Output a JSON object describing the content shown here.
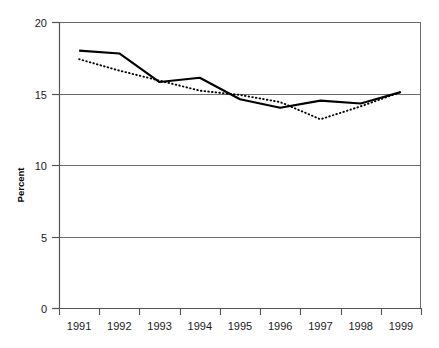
{
  "chart_data": {
    "type": "line",
    "title": "",
    "xlabel": "",
    "ylabel": "Percent",
    "x": [
      "1991",
      "1992",
      "1993",
      "1994",
      "1995",
      "1996",
      "1997",
      "1998",
      "1999"
    ],
    "categories": [
      "1991",
      "1992",
      "1993",
      "1994",
      "1995",
      "1996",
      "1997",
      "1998",
      "1999"
    ],
    "ylim": [
      0,
      20
    ],
    "xlim": [
      "1991",
      "1999"
    ],
    "yticks": [
      "0",
      "5",
      "10",
      "15",
      "20"
    ],
    "ytick_values": [
      0,
      5,
      10,
      15,
      20
    ],
    "grid": "horizontal",
    "legend": "none",
    "series": [
      {
        "name": "solid-series",
        "style": "solid",
        "color": "#000000",
        "values": [
          18.0,
          17.8,
          15.8,
          16.1,
          14.6,
          14.0,
          14.5,
          14.3,
          15.1
        ]
      },
      {
        "name": "dotted-series",
        "style": "dotted",
        "color": "#000000",
        "values": [
          17.4,
          16.6,
          15.9,
          15.2,
          14.9,
          14.4,
          13.2,
          14.1,
          15.1
        ]
      }
    ],
    "annotations": []
  },
  "axis": {
    "y_label_text": "Percent",
    "y_ticks": [
      {
        "label": "20",
        "value": 20
      },
      {
        "label": "15",
        "value": 15
      },
      {
        "label": "10",
        "value": 10
      },
      {
        "label": "5",
        "value": 5
      },
      {
        "label": "0",
        "value": 0
      }
    ],
    "x_ticks": [
      {
        "label": "1991"
      },
      {
        "label": "1992"
      },
      {
        "label": "1993"
      },
      {
        "label": "1994"
      },
      {
        "label": "1995"
      },
      {
        "label": "1996"
      },
      {
        "label": "1997"
      },
      {
        "label": "1998"
      },
      {
        "label": "1999"
      }
    ]
  },
  "colors": {
    "axis": "#555555",
    "grid": "#6b6b6b",
    "series_primary": "#111111",
    "series_secondary": "#222222",
    "background": "#ffffff",
    "text": "#1a1a1a"
  }
}
